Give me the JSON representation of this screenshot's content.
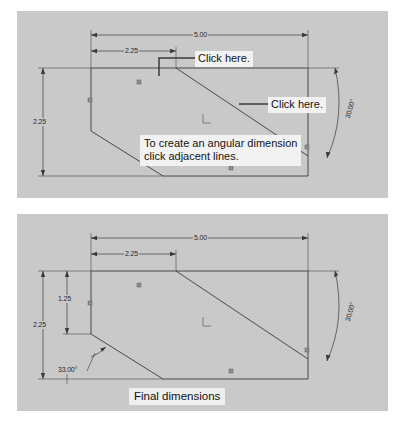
{
  "document": {
    "type": "cad-tutorial-figure",
    "panel_background": "#c9c9c9",
    "line_color": "#3a3a3a"
  },
  "panels": [
    {
      "id": "top",
      "name": "angular-dimension-instruction-panel",
      "callouts": [
        {
          "label": "Click here.",
          "target": "top-horizontal-edge"
        },
        {
          "label": "Click here.",
          "target": "diagonal-edge"
        }
      ],
      "tip": {
        "line1": "To create an angular dimension",
        "line2": "click adjacent lines."
      },
      "dimensions": [
        {
          "name": "overall-width",
          "value": "5.00",
          "orientation": "horizontal"
        },
        {
          "name": "notch-width",
          "value": "2.25",
          "orientation": "horizontal"
        },
        {
          "name": "overall-height",
          "value": "2.25",
          "orientation": "vertical"
        },
        {
          "name": "chamfer-angle",
          "value": "30.00°",
          "orientation": "angular"
        }
      ]
    },
    {
      "id": "bottom",
      "name": "final-dimensions-panel",
      "caption": "Final dimensions",
      "dimensions": [
        {
          "name": "overall-width",
          "value": "5.00",
          "orientation": "horizontal"
        },
        {
          "name": "notch-width",
          "value": "2.25",
          "orientation": "horizontal"
        },
        {
          "name": "upper-left-height",
          "value": "1.25",
          "orientation": "vertical"
        },
        {
          "name": "overall-height",
          "value": "2.25",
          "orientation": "vertical"
        },
        {
          "name": "right-chamfer-angle",
          "value": "30.00°",
          "orientation": "angular"
        },
        {
          "name": "left-chamfer-angle",
          "value": "33.00°",
          "orientation": "angular"
        }
      ]
    }
  ]
}
